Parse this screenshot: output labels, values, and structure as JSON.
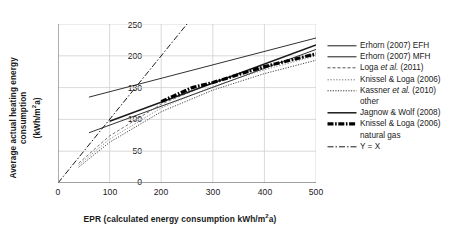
{
  "chart_data": {
    "type": "line",
    "title": "",
    "xlabel": "EPR (calculated energy consumption kWh/m²a)",
    "ylabel": "Average actual heating energy consumption (kWh/m²a)",
    "xlim": [
      0,
      500
    ],
    "ylim": [
      0,
      250
    ],
    "xticks": [
      0,
      100,
      200,
      300,
      400,
      500
    ],
    "yticks": [
      0,
      50,
      100,
      150,
      200,
      250
    ],
    "grid": true,
    "legend_position": "right",
    "series": [
      {
        "name": "Erhorn (2007) EFH",
        "style": "solid",
        "x": [
          60,
          500
        ],
        "y": [
          135,
          228
        ]
      },
      {
        "name": "Erhorn (2007) MFH",
        "style": "solid",
        "x": [
          60,
          500
        ],
        "y": [
          79,
          210
        ]
      },
      {
        "name": "Loga et al. (2011)",
        "style": "dashed-fine",
        "x": [
          40,
          100,
          200,
          300,
          400,
          500
        ],
        "y": [
          31,
          74,
          124,
          158,
          183,
          203
        ]
      },
      {
        "name": "Knissel & Loga (2006)",
        "style": "dotted-fine",
        "x": [
          40,
          100,
          200,
          300,
          400,
          500
        ],
        "y": [
          28,
          69,
          118,
          152,
          178,
          200
        ]
      },
      {
        "name": "Kassner et al. (2010) other",
        "style": "dotted",
        "x": [
          40,
          100,
          200,
          300,
          400,
          500
        ],
        "y": [
          25,
          64,
          112,
          146,
          172,
          193
        ]
      },
      {
        "name": "Jagnow & Wolf (2008)",
        "style": "solid-thick",
        "x": [
          100,
          500
        ],
        "y": [
          97,
          217
        ]
      },
      {
        "name": "Knissel & Loga (2006) natural gas",
        "style": "dashdot-thick",
        "x": [
          200,
          260,
          300,
          400,
          500
        ],
        "y": [
          128,
          150,
          158,
          183,
          203
        ]
      },
      {
        "name": "Y = X",
        "style": "dashdot",
        "x": [
          0,
          250
        ],
        "y": [
          0,
          250
        ]
      }
    ]
  },
  "axes": {
    "y_title_line1": "Average actual heating energy consumption",
    "y_title_line2_pre": "(kWh/m",
    "y_title_line2_sup": "2",
    "y_title_line2_post": "a)",
    "x_title_pre": "EPR (calculated energy consumption kWh/m",
    "x_title_sup": "2",
    "x_title_post": "a)",
    "yticks": [
      "250",
      "200",
      "150",
      "100",
      "50",
      "0"
    ],
    "xticks": [
      "0",
      "100",
      "200",
      "300",
      "400",
      "500"
    ]
  },
  "legend": {
    "items": [
      {
        "label": "Erhorn (2007) EFH",
        "style": "solid",
        "cont": ""
      },
      {
        "label": "Erhorn (2007) MFH",
        "style": "solid",
        "cont": ""
      },
      {
        "label_pre": "Loga ",
        "label_it": "et al.",
        "label_post": " (2011)",
        "style": "dashed-fine",
        "cont": ""
      },
      {
        "label": "Knissel & Loga (2006)",
        "style": "dotted-fine",
        "cont": ""
      },
      {
        "label_pre": "Kassner ",
        "label_it": "et al.",
        "label_post": " (2010)",
        "style": "dotted",
        "cont": "other"
      },
      {
        "label": "Jagnow & Wolf (2008)",
        "style": "solid-thick",
        "cont": ""
      },
      {
        "label": "Knissel & Loga (2006)",
        "style": "dashdot-thick",
        "cont": "natural gas"
      },
      {
        "label": "Y = X",
        "style": "dashdot",
        "cont": ""
      }
    ]
  },
  "colors": {
    "ink": "#1a1a1a",
    "axis": "#808080",
    "grid": "#cfcfcf",
    "background": "#ffffff"
  }
}
